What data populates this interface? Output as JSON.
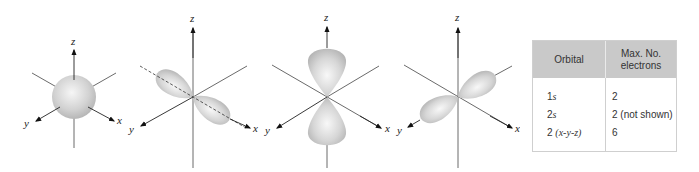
{
  "diagrams": [
    {
      "name": "s-orbital",
      "axis_labels": {
        "x": "x",
        "y": "y",
        "z": "z"
      }
    },
    {
      "name": "px-orbital",
      "axis_labels": {
        "x": "x",
        "y": "y",
        "z": "z"
      }
    },
    {
      "name": "pz-orbital",
      "axis_labels": {
        "x": "x",
        "y": "y",
        "z": "z"
      }
    },
    {
      "name": "py-orbital",
      "axis_labels": {
        "x": "x",
        "y": "y",
        "z": "z"
      }
    }
  ],
  "colors": {
    "orbital_fill": "#c8c8c8",
    "orbital_highlight": "#f4f4f4",
    "axis": "#333333",
    "table_header_bg": "#c9c9c9",
    "table_border": "#cfcfcf"
  },
  "table": {
    "headers": [
      "Orbital",
      "Max. No.",
      "electrons"
    ],
    "rows": [
      {
        "orbital_num": "1",
        "orbital_sub": "s",
        "electrons": "2"
      },
      {
        "orbital_num": "2",
        "orbital_sub": "s",
        "electrons": "2 (not shown)"
      },
      {
        "orbital_num": "2 ",
        "orbital_sub": "(x-y-z)",
        "electrons": "6"
      }
    ]
  }
}
